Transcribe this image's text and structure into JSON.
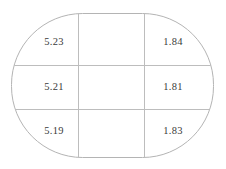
{
  "figure": {
    "name": "rounded-rectangle-grid-diagram",
    "background_color": "#ffffff",
    "outline_color": "#b4b4b4",
    "grid_line_color": "#bdbdbd",
    "text_color": "#3a3a3a",
    "shape": {
      "type": "rounded-rectangle",
      "left": 11,
      "top": 13,
      "right": 214,
      "bottom": 158,
      "corner_radius": 72
    },
    "grid": {
      "columns": 3,
      "rows": 3,
      "vertical_lines_x": [
        78,
        144
      ],
      "horizontal_lines_y": [
        65,
        109
      ]
    }
  },
  "cells": [
    {
      "name": "cell-row1-col1",
      "row": 1,
      "col": 1,
      "value": "5.23",
      "x": 54,
      "y": 42
    },
    {
      "name": "cell-row1-col2",
      "row": 1,
      "col": 2,
      "value": "",
      "x": 111,
      "y": 42
    },
    {
      "name": "cell-row1-col3",
      "row": 1,
      "col": 3,
      "value": "1.84",
      "x": 173,
      "y": 42
    },
    {
      "name": "cell-row2-col1",
      "row": 2,
      "col": 1,
      "value": "5.21",
      "x": 54,
      "y": 87
    },
    {
      "name": "cell-row2-col2",
      "row": 2,
      "col": 2,
      "value": "",
      "x": 111,
      "y": 87
    },
    {
      "name": "cell-row2-col3",
      "row": 2,
      "col": 3,
      "value": "1.81",
      "x": 173,
      "y": 87
    },
    {
      "name": "cell-row3-col1",
      "row": 3,
      "col": 1,
      "value": "5.19",
      "x": 54,
      "y": 131
    },
    {
      "name": "cell-row3-col2",
      "row": 3,
      "col": 2,
      "value": "",
      "x": 111,
      "y": 131
    },
    {
      "name": "cell-row3-col3",
      "row": 3,
      "col": 3,
      "value": "1.83",
      "x": 173,
      "y": 131
    }
  ]
}
